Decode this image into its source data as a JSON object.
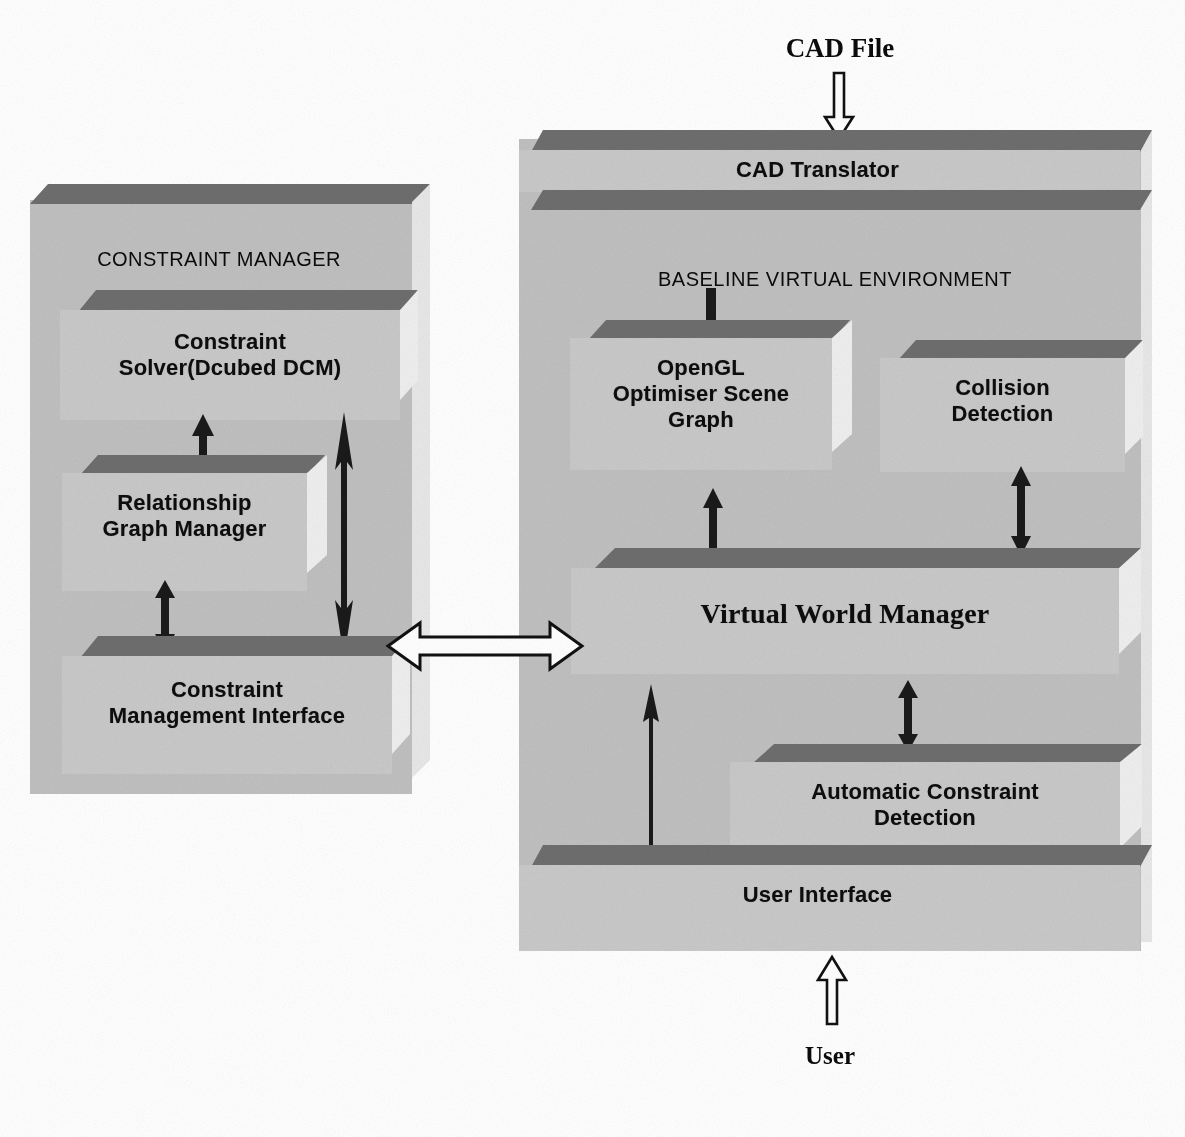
{
  "diagram": {
    "external_labels": [
      {
        "id": "cad-file",
        "text": "CAD File"
      },
      {
        "id": "user",
        "text": "User"
      }
    ],
    "panels": [
      {
        "id": "constraint-manager",
        "title": "CONSTRAINT MANAGER",
        "blocks": [
          {
            "id": "constraint-solver",
            "label": "Constraint\nSolver(Dcubed DCM)",
            "line1": "Constraint",
            "line2": "Solver(Dcubed DCM)"
          },
          {
            "id": "relationship-graph-manager",
            "label": "Relationship\nGraph Manager",
            "line1": "Relationship",
            "line2": "Graph Manager"
          },
          {
            "id": "constraint-management-interface",
            "label": "Constraint\nManagement Interface",
            "line1": "Constraint",
            "line2": "Management Interface"
          }
        ]
      },
      {
        "id": "baseline-virtual-environment-panel",
        "title": "BASELINE VIRTUAL ENVIRONMENT",
        "blocks": [
          {
            "id": "cad-translator",
            "label": "CAD Translator",
            "line1": "CAD Translator",
            "line2": ""
          },
          {
            "id": "opengl-optimiser-scene-graph",
            "label": "OpenGL\nOptimiser Scene\nGraph",
            "line1": "OpenGL",
            "line2": "Optimiser Scene",
            "line3": "Graph"
          },
          {
            "id": "collision-detection",
            "label": "Collision\nDetection",
            "line1": "Collision",
            "line2": "Detection"
          },
          {
            "id": "virtual-world-manager",
            "label": "Virtual World Manager",
            "line1": "Virtual World Manager",
            "line2": ""
          },
          {
            "id": "automatic-constraint-detection",
            "label": "Automatic Constraint\nDetection",
            "line1": "Automatic Constraint",
            "line2": "Detection"
          },
          {
            "id": "user-interface",
            "label": "User Interface",
            "line1": "User Interface",
            "line2": ""
          }
        ]
      }
    ],
    "connectors": [
      {
        "id": "cad-file-input-arrow",
        "style": "hollow",
        "direction": "down",
        "from": "CAD File",
        "to": "CAD Translator"
      },
      {
        "id": "user-input-arrow",
        "style": "hollow",
        "direction": "up",
        "from": "User",
        "to": "User Interface"
      },
      {
        "id": "panel-link-arrow",
        "style": "hollow",
        "direction": "bidirectional",
        "from": "Constraint Management Interface",
        "to": "Virtual World Manager"
      },
      {
        "id": "solver-to-graph-arrow",
        "style": "solid",
        "direction": "up",
        "from": "Relationship Graph Manager",
        "to": "Constraint Solver(Dcubed DCM)"
      },
      {
        "id": "graph-to-interface-arrow",
        "style": "solid",
        "direction": "bidirectional",
        "from": "Relationship Graph Manager",
        "to": "Constraint Management Interface"
      },
      {
        "id": "solver-to-interface-long-arrow",
        "style": "solid",
        "direction": "bidirectional",
        "from": "Constraint Solver(Dcubed DCM)",
        "to": "Constraint Management Interface"
      },
      {
        "id": "bve-title-arrow",
        "style": "solid",
        "direction": "down",
        "from": "BASELINE VIRTUAL ENVIRONMENT",
        "to": "OpenGL Optimiser Scene Graph"
      },
      {
        "id": "scenegraph-to-vwm-arrow",
        "style": "solid",
        "direction": "bidirectional",
        "from": "OpenGL Optimiser Scene Graph",
        "to": "Virtual World Manager"
      },
      {
        "id": "collision-to-vwm-arrow",
        "style": "solid",
        "direction": "bidirectional",
        "from": "Collision Detection",
        "to": "Virtual World Manager"
      },
      {
        "id": "vwm-to-acd-arrow",
        "style": "solid",
        "direction": "bidirectional",
        "from": "Virtual World Manager",
        "to": "Automatic Constraint Detection"
      },
      {
        "id": "ui-to-vwm-arrow",
        "style": "solid",
        "direction": "up",
        "from": "User Interface",
        "to": "Virtual World Manager"
      }
    ],
    "colors": {
      "slab_top": "#6e6e6e",
      "slab_face": "#c9c9c9",
      "slab_side": "#efefef",
      "panel_fill": "#bdbdbd",
      "text": "#0d0d0d",
      "arrow_solid": "#1a1a1a",
      "arrow_hollow_fill": "#ffffff",
      "background": "#ffffff"
    }
  }
}
